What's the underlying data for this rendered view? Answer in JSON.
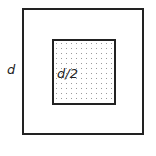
{
  "diagram": {
    "outer_square": {
      "label": "d"
    },
    "inner_square": {
      "label": "d/2",
      "fill": "dotted"
    },
    "caption": ""
  }
}
